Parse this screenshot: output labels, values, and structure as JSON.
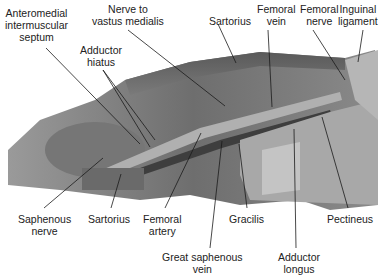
{
  "figure": {
    "labels": [
      {
        "id": "anteromedial-intermuscular-septum",
        "text": "Anteromedial\nintermuscular\nseptum",
        "x": 44,
        "y": 7
      },
      {
        "id": "nerve-to-vastus-medialis",
        "text": "Nerve to\nvastus medialis",
        "x": 130,
        "y": 3
      },
      {
        "id": "adductor-hiatus",
        "text": "Adductor\nhiatus",
        "x": 101,
        "y": 44
      },
      {
        "id": "sartorius-top",
        "text": "Sartorius",
        "x": 235,
        "y": 15
      },
      {
        "id": "femoral-vein",
        "text": "Femoral\nvein",
        "x": 278,
        "y": 3
      },
      {
        "id": "femoral-nerve",
        "text": "Femoral\nnerve",
        "x": 322,
        "y": 3
      },
      {
        "id": "inguinal-ligament",
        "text": "Inguinal\nligament",
        "x": 361,
        "y": 3
      },
      {
        "id": "saphenous-nerve",
        "text": "Saphenous\nnerve",
        "x": 45,
        "y": 213
      },
      {
        "id": "sartorius-bottom",
        "text": "Sartorius",
        "x": 109,
        "y": 213
      },
      {
        "id": "femoral-artery",
        "text": "Femoral\nartery",
        "x": 163,
        "y": 213
      },
      {
        "id": "great-saphenous-vein",
        "text": "Great saphenous\nvein",
        "x": 224,
        "y": 251
      },
      {
        "id": "gracilis",
        "text": "Gracilis",
        "x": 256,
        "y": 213
      },
      {
        "id": "pectineus",
        "text": "Pectineus",
        "x": 350,
        "y": 213
      },
      {
        "id": "adductor-longus",
        "text": "Adductor\nlongus",
        "x": 297,
        "y": 251
      }
    ]
  },
  "colors": {
    "background": "#ffffff",
    "text": "#222222",
    "leader": "#1a1a1a"
  }
}
